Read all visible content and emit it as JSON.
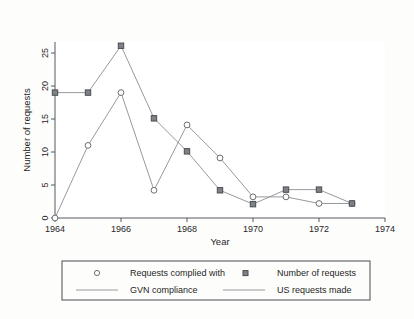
{
  "chart_data": {
    "type": "line",
    "title": "",
    "xlabel": "Year",
    "ylabel": "Number of requests",
    "x": [
      1964,
      1965,
      1966,
      1967,
      1968,
      1969,
      1970,
      1971,
      1972,
      1973
    ],
    "xlim": [
      1964,
      1974
    ],
    "ylim": [
      0,
      27
    ],
    "xticks": [
      1964,
      1966,
      1968,
      1970,
      1972,
      1974
    ],
    "xtick_labels": [
      "1964",
      "1966",
      "1968",
      "1970",
      "1972",
      "1974"
    ],
    "yticks": [
      0,
      5,
      10,
      15,
      20,
      25
    ],
    "ytick_labels": [
      "0",
      "5",
      "10",
      "15",
      "20",
      "25"
    ],
    "grid": false,
    "legend_position": "below-axes",
    "series": [
      {
        "name": "Requests complied with",
        "marker": "open-circle",
        "line_name": "GVN compliance",
        "values": [
          0,
          11,
          19,
          4.2,
          14.1,
          9.1,
          3.2,
          3.2,
          2.2,
          2.2
        ]
      },
      {
        "name": "Number of requests",
        "marker": "filled-square",
        "line_name": "US requests made",
        "values": [
          19,
          19,
          26.1,
          15.1,
          10.1,
          4.2,
          2.1,
          4.3,
          4.3,
          2.2
        ]
      }
    ]
  },
  "axes": {
    "y_title": "Number of requests",
    "x_title": "Year"
  },
  "legend": {
    "entries": [
      {
        "key": "marker-circle",
        "label": "Requests complied with"
      },
      {
        "key": "marker-square",
        "label": "Number of requests"
      },
      {
        "key": "line-solid",
        "label": "GVN compliance"
      },
      {
        "key": "line-solid-2",
        "label": "US requests made"
      }
    ]
  },
  "colors": {
    "series_line": "#8a8d92",
    "marker_fill": "#7e8186",
    "axis": "#55585c",
    "text": "#262626",
    "background": "#fdfdfc"
  }
}
